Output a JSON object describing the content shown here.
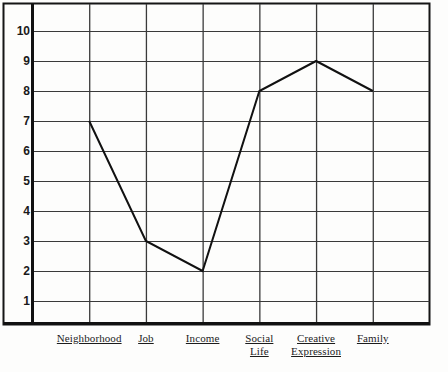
{
  "chart_data": {
    "type": "line",
    "title": "",
    "subtitle": "",
    "xlabel": "",
    "ylabel": "",
    "categories": [
      "Neighborhood",
      "Job",
      "Income",
      "Social Life",
      "Creative Expression",
      "Family"
    ],
    "values": [
      7,
      3,
      2,
      8,
      9,
      8
    ],
    "series": [
      {
        "name": "",
        "values": [
          7,
          3,
          2,
          8,
          9,
          8
        ]
      }
    ],
    "yticks": [
      10,
      9,
      8,
      7,
      6,
      5,
      4,
      3,
      2,
      1
    ],
    "ylim": [
      0,
      11
    ],
    "grid": true,
    "legend": false,
    "legend_position": "none",
    "markers": false,
    "line_color": "#111111",
    "grid_color": "#3a3a3a",
    "axis_color": "#111111",
    "background_color": "#fdfdfc"
  },
  "axis": {
    "y_tick_labels": [
      "10",
      "9",
      "8",
      "7",
      "6",
      "5",
      "4",
      "3",
      "2",
      "1"
    ]
  },
  "x_categories": [
    {
      "line1": "Neighborhood",
      "line2": ""
    },
    {
      "line1": "Job",
      "line2": ""
    },
    {
      "line1": "Income",
      "line2": ""
    },
    {
      "line1": "Social",
      "line2": "Life"
    },
    {
      "line1": "Creative",
      "line2": "Expression"
    },
    {
      "line1": "Family",
      "line2": ""
    }
  ]
}
